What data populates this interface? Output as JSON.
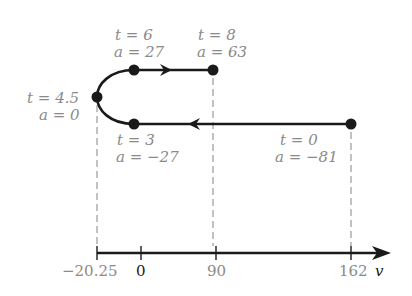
{
  "diagram": {
    "axis": {
      "variable": "v",
      "ticks": [
        {
          "label": "−20.25",
          "value": -20.25,
          "style": "gray"
        },
        {
          "label": "0",
          "value": 0,
          "style": "dark"
        },
        {
          "label": "90",
          "value": 90,
          "style": "gray"
        },
        {
          "label": "162",
          "value": 162,
          "style": "gray"
        }
      ]
    },
    "points": [
      {
        "id": "t0",
        "t_label": "t = 0",
        "a_label": "a = −81",
        "t": 0,
        "a": -81,
        "v": 162
      },
      {
        "id": "t3",
        "t_label": "t = 3",
        "a_label": "a = −27",
        "t": 3,
        "a": -27,
        "v": 0
      },
      {
        "id": "t4_5",
        "t_label": "t = 4.5",
        "a_label": "a = 0",
        "t": 4.5,
        "a": 0,
        "v": -20.25
      },
      {
        "id": "t6",
        "t_label": "t = 6",
        "a_label": "a = 27",
        "t": 6,
        "a": 27,
        "v": 0
      },
      {
        "id": "t8",
        "t_label": "t = 8",
        "a_label": "a = 63",
        "t": 8,
        "a": 63,
        "v": 90
      }
    ],
    "colors": {
      "line": "#1a1a1a",
      "label": "#8a8a8a",
      "dashed": "#9a9a9a"
    }
  }
}
